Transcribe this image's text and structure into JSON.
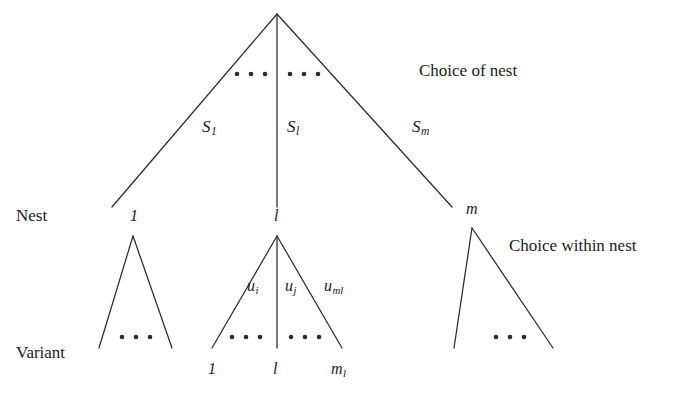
{
  "figure": {
    "type": "nested-tree-diagram",
    "background": "#ffffff",
    "line_color": "#2b2b2b",
    "text_color": "#1a1a1a"
  },
  "row_labels": {
    "nest": "Nest",
    "variant": "Variant"
  },
  "side_labels": {
    "choice_of_nest": "Choice of nest",
    "choice_within_nest": "Choice within nest"
  },
  "upper_branch_labels": [
    {
      "base": "S",
      "sub": "1"
    },
    {
      "base": "S",
      "sub": "l"
    },
    {
      "base": "S",
      "sub": "m"
    }
  ],
  "nest_nodes": [
    {
      "base": "1",
      "sub": ""
    },
    {
      "base": "l",
      "sub": ""
    },
    {
      "base": "m",
      "sub": ""
    }
  ],
  "utility_labels": [
    {
      "base": "u",
      "sub": "i"
    },
    {
      "base": "u",
      "sub": "j"
    },
    {
      "base": "u",
      "sub": "ml"
    }
  ],
  "variant_nodes": [
    {
      "base": "1",
      "sub": ""
    },
    {
      "base": "l",
      "sub": ""
    },
    {
      "base": "m",
      "sub": "l"
    }
  ],
  "ellipses": {
    "count_per_group": 3,
    "groups": 7,
    "glyph": "•"
  }
}
